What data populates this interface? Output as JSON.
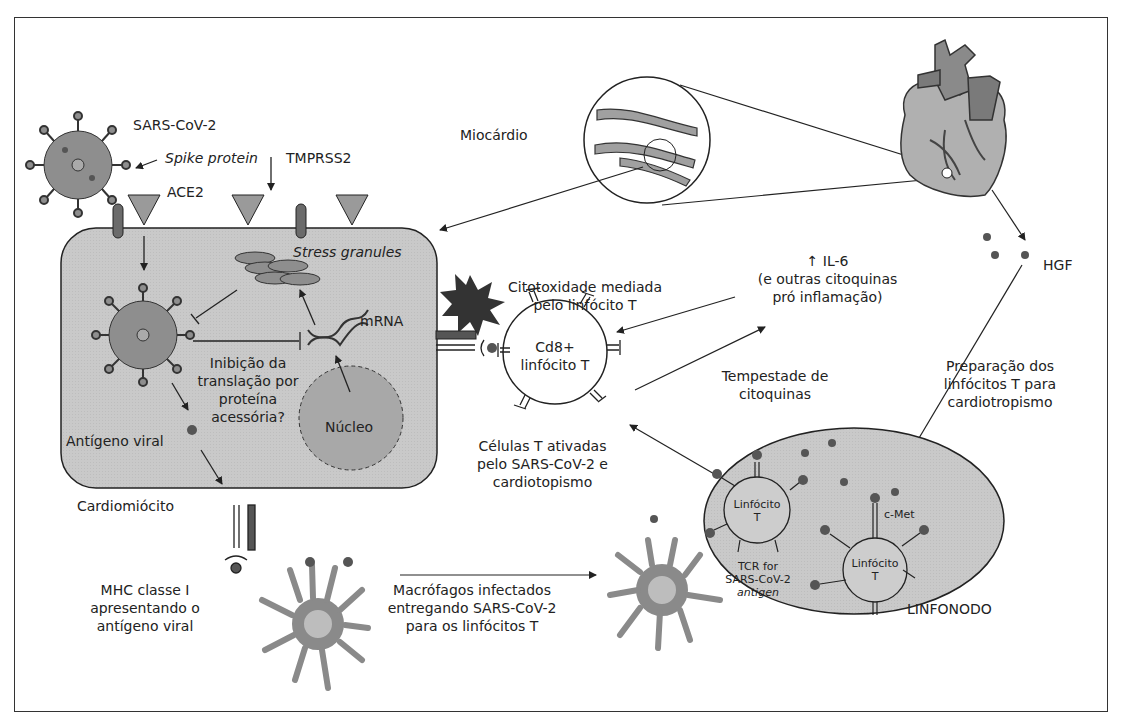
{
  "labels": {
    "sars_cov_2": "SARS-CoV-2",
    "spike_protein": "Spike protein",
    "tmprss2": "TMPRSS2",
    "ace2": "ACE2",
    "miocardio": "Miocárdio",
    "stress_granules": "Stress granules",
    "mrna": "mRNA",
    "inibicao": [
      "Inibição da",
      "translação por",
      "proteína",
      "acessória?"
    ],
    "nucleo": "Núcleo",
    "antigeno_viral": "Antígeno viral",
    "cardiomiocito": "Cardiomiócito",
    "mhc": [
      "MHC classe I",
      "apresentando o",
      "antígeno viral"
    ],
    "macrofagos": [
      "Macrófagos infectados",
      "entregando SARS-CoV-2",
      "para os linfócitos T"
    ],
    "citotoxidade": [
      "Citotoxidade mediada",
      "pelo linfócito T"
    ],
    "cd8": [
      "Cd8+",
      "linfócito T"
    ],
    "celulas_t": [
      "Células T ativadas",
      "pelo SARS-CoV-2 e",
      "cardiotopismo"
    ],
    "il6": [
      "↑ IL-6",
      "(e outras citoquinas",
      "pró inflamação)"
    ],
    "tempestade": [
      "Tempestade de",
      "citoquinas"
    ],
    "hgf": "HGF",
    "preparacao": [
      "Preparação dos",
      "linfócitos T para",
      "cardiotropismo"
    ],
    "linfocito_t1": [
      "Linfócito",
      "T"
    ],
    "linfocito_t2": [
      "Linfócito",
      "T"
    ],
    "c_met": "c-Met",
    "tcr": [
      "TCR  for",
      "SARS-CoV-2"
    ],
    "antigen": "antigen",
    "linfonodo": "LINFONODO"
  },
  "colors": {
    "cell_fill": "#c8c8c8",
    "dark": "#555555",
    "mid": "#8a8a8a",
    "node_fill": "#cfcfcf"
  }
}
